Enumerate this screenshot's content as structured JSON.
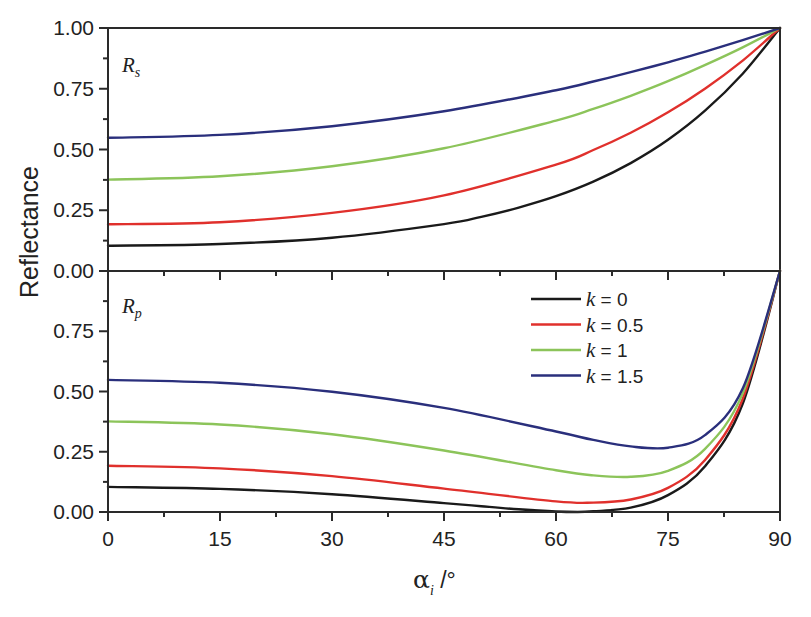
{
  "chart_data": [
    {
      "type": "line",
      "panel": "top",
      "title": "",
      "panel_label": "R",
      "panel_label_sub": "s",
      "xlabel": "α_i /°",
      "ylabel": "Reflectance",
      "xlim": [
        0,
        90
      ],
      "ylim": [
        0,
        1
      ],
      "xticks": [
        0,
        15,
        30,
        45,
        60,
        75,
        90
      ],
      "yticks": [
        0.0,
        0.25,
        0.5,
        0.75,
        1.0
      ],
      "grid": false,
      "series": [
        {
          "name": "k = 0",
          "color": "#1a1a1a",
          "x": [
            0,
            15,
            30,
            45,
            50,
            55,
            60,
            65,
            70,
            75,
            80,
            85,
            90
          ],
          "values": [
            0.104,
            0.111,
            0.137,
            0.193,
            0.223,
            0.261,
            0.308,
            0.368,
            0.444,
            0.54,
            0.661,
            0.812,
            1.0
          ]
        },
        {
          "name": "k = 0.5",
          "color": "#e0302c",
          "x": [
            0,
            15,
            30,
            45,
            60,
            65,
            70,
            75,
            80,
            85,
            90
          ],
          "values": [
            0.192,
            0.201,
            0.239,
            0.311,
            0.438,
            0.498,
            0.569,
            0.653,
            0.751,
            0.866,
            1.0
          ]
        },
        {
          "name": "k = 1",
          "color": "#8cc45a",
          "x": [
            0,
            15,
            30,
            45,
            60,
            65,
            70,
            75,
            80,
            85,
            90
          ],
          "values": [
            0.376,
            0.39,
            0.431,
            0.505,
            0.619,
            0.667,
            0.721,
            0.781,
            0.848,
            0.92,
            1.0
          ]
        },
        {
          "name": "k = 1.5",
          "color": "#2a2f7c",
          "x": [
            0,
            15,
            30,
            45,
            60,
            65,
            70,
            75,
            80,
            85,
            90
          ],
          "values": [
            0.548,
            0.56,
            0.596,
            0.657,
            0.744,
            0.78,
            0.818,
            0.859,
            0.903,
            0.95,
            1.0
          ]
        }
      ]
    },
    {
      "type": "line",
      "panel": "bottom",
      "title": "",
      "panel_label": "R",
      "panel_label_sub": "p",
      "xlabel": "α_i /°",
      "ylabel": "Reflectance",
      "xlim": [
        0,
        90
      ],
      "ylim": [
        0,
        1
      ],
      "xticks": [
        0,
        15,
        30,
        45,
        60,
        75,
        90
      ],
      "yticks": [
        0.0,
        0.25,
        0.5,
        0.75
      ],
      "grid": false,
      "legend_position": "upper right",
      "series": [
        {
          "name": "k = 0",
          "color": "#1a1a1a",
          "x": [
            0,
            15,
            30,
            45,
            50,
            55,
            60,
            62.9,
            65,
            70,
            75,
            80,
            85,
            90
          ],
          "values": [
            0.104,
            0.096,
            0.074,
            0.037,
            0.024,
            0.011,
            0.002,
            0.0,
            0.003,
            0.018,
            0.07,
            0.191,
            0.449,
            1.0
          ]
        },
        {
          "name": "k = 0.5",
          "color": "#e0302c",
          "x": [
            0,
            15,
            30,
            45,
            60,
            65,
            70,
            75,
            80,
            85,
            90
          ],
          "values": [
            0.192,
            0.181,
            0.149,
            0.097,
            0.044,
            0.039,
            0.052,
            0.1,
            0.217,
            0.469,
            1.0
          ]
        },
        {
          "name": "k = 1",
          "color": "#8cc45a",
          "x": [
            0,
            15,
            30,
            45,
            60,
            65,
            70,
            75,
            80,
            85,
            90
          ],
          "values": [
            0.376,
            0.363,
            0.323,
            0.255,
            0.173,
            0.152,
            0.146,
            0.171,
            0.263,
            0.492,
            1.0
          ]
        },
        {
          "name": "k = 1.5",
          "color": "#2a2f7c",
          "x": [
            0,
            15,
            30,
            45,
            60,
            65,
            70,
            75,
            80,
            85,
            90
          ],
          "values": [
            0.548,
            0.536,
            0.499,
            0.432,
            0.334,
            0.299,
            0.272,
            0.267,
            0.32,
            0.512,
            1.0
          ]
        }
      ]
    }
  ],
  "axes": {
    "ylabel": "Reflectance",
    "xlabel_symbol": "α",
    "xlabel_sub": "i",
    "xlabel_unit": " /°",
    "x_tick_labels": [
      "0",
      "15",
      "30",
      "45",
      "60",
      "75",
      "90"
    ],
    "top_y_tick_labels": [
      "0.00",
      "0.25",
      "0.50",
      "0.75",
      "1.00"
    ],
    "bottom_y_tick_labels": [
      "0.00",
      "0.25",
      "0.50",
      "0.75"
    ]
  },
  "legend": {
    "items": [
      {
        "k": "k",
        "text": " = 0",
        "color": "#1a1a1a"
      },
      {
        "k": "k",
        "text": " = 0.5",
        "color": "#e0302c"
      },
      {
        "k": "k",
        "text": " = 1",
        "color": "#8cc45a"
      },
      {
        "k": "k",
        "text": " = 1.5",
        "color": "#2a2f7c"
      }
    ]
  }
}
